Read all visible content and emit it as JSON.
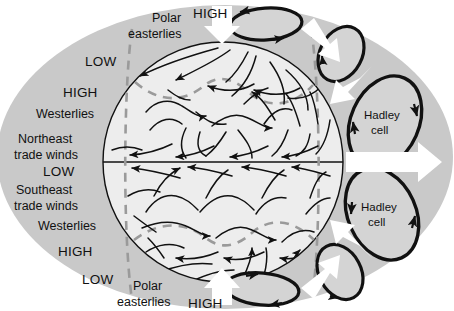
{
  "figure": {
    "colors": {
      "background": "#ffffff",
      "halo_gray": "#c9c9c9",
      "globe_fill": "#ededed",
      "cell_fill": "#d4d4d4",
      "stroke_black": "#111111",
      "dashed_gray": "#9a9a9a",
      "arrow_white": "#ffffff",
      "text": "#111111"
    }
  },
  "labels": {
    "left_stack": [
      {
        "id": "low-north-polar",
        "text": "LOW",
        "x": 99,
        "y": 66,
        "style": "cap",
        "anchor": "middle"
      },
      {
        "id": "high-north-subpolar",
        "text": "HIGH",
        "x": 72,
        "y": 95,
        "style": "cap",
        "anchor": "start"
      },
      {
        "id": "westerlies-north",
        "text": "Westerlies",
        "x": 45,
        "y": 115,
        "style": "word",
        "anchor": "start"
      },
      {
        "id": "northeast-trades-line1",
        "text": "Northeast",
        "x": 23,
        "y": 140,
        "style": "word",
        "anchor": "start"
      },
      {
        "id": "northeast-trades-line2",
        "text": "trade winds",
        "x": 14,
        "y": 155,
        "style": "word",
        "anchor": "start"
      },
      {
        "id": "low-equator",
        "text": "LOW",
        "x": 45,
        "y": 172,
        "style": "cap",
        "anchor": "start"
      },
      {
        "id": "southeast-trades-line1",
        "text": "Southeast",
        "x": 18,
        "y": 190,
        "style": "word",
        "anchor": "start"
      },
      {
        "id": "southeast-trades-line2",
        "text": "trade winds",
        "x": 14,
        "y": 206,
        "style": "word",
        "anchor": "start"
      },
      {
        "id": "westerlies-south",
        "text": "Westerlies",
        "x": 45,
        "y": 226,
        "style": "word",
        "anchor": "start"
      },
      {
        "id": "high-south-subpolar",
        "text": "HIGH",
        "x": 63,
        "y": 253,
        "style": "cap",
        "anchor": "start"
      },
      {
        "id": "low-south-polar",
        "text": "LOW",
        "x": 87,
        "y": 281,
        "style": "cap",
        "anchor": "start"
      }
    ],
    "polar_easterlies_north": {
      "line1": "Polar",
      "line2": "easterlies",
      "x1": 157,
      "y1": 21,
      "x2": 136,
      "y2": 36
    },
    "polar_easterlies_south": {
      "line1": "Polar",
      "line2": "easterlies",
      "x1": 136,
      "y1": 290,
      "x2": 122,
      "y2": 305
    },
    "high_north_pole": {
      "text": "HIGH",
      "x": 196,
      "y": 17
    },
    "high_south_pole": {
      "text": "HIGH",
      "x": 196,
      "y": 307
    },
    "hadley_north": {
      "line1": "Hadley",
      "line2": "cell",
      "x": 385,
      "y": 116,
      "line2_y": 131
    },
    "hadley_south": {
      "line1": "Hadley",
      "line2": "cell",
      "x": 382,
      "y": 208,
      "line2_y": 223
    }
  },
  "geometry": {
    "halo_ellipse": {
      "cx": 225,
      "cy": 157,
      "rx": 228,
      "ry": 152
    },
    "globe": {
      "cx": 223,
      "cy": 162,
      "r": 120
    },
    "equator": {
      "x1": 103,
      "x2": 343,
      "y": 162
    }
  },
  "cells": [
    {
      "id": "polar-cell-north-top",
      "label": "",
      "cx": 266,
      "cy": 24,
      "rx": 36,
      "ry": 16,
      "rot": -4
    },
    {
      "id": "ferrel-cell-north",
      "label": "",
      "cx": 341,
      "cy": 54,
      "rx": 22,
      "ry": 30,
      "rot": 28
    },
    {
      "id": "hadley-cell-north",
      "label": "Hadley cell",
      "cx": 385,
      "cy": 122,
      "rx": 34,
      "ry": 48,
      "rot": 24
    },
    {
      "id": "hadley-cell-south",
      "label": "Hadley cell",
      "cx": 382,
      "cy": 214,
      "rx": 34,
      "ry": 48,
      "rot": -24
    },
    {
      "id": "ferrel-cell-south",
      "label": "",
      "cx": 340,
      "cy": 272,
      "rx": 21,
      "ry": 29,
      "rot": -28
    },
    {
      "id": "polar-cell-south-bottom",
      "label": "",
      "cx": 262,
      "cy": 289,
      "rx": 37,
      "ry": 16,
      "rot": 5
    }
  ],
  "white_arrows": [
    {
      "id": "arrow-north-pole-down",
      "dir": "down"
    },
    {
      "id": "arrow-subpolar-north-down-right",
      "dir": "down-right"
    },
    {
      "id": "arrow-subtropical-north-down",
      "dir": "down-left"
    },
    {
      "id": "arrow-equator-right",
      "dir": "right"
    },
    {
      "id": "arrow-subtropical-south-up",
      "dir": "up-left"
    },
    {
      "id": "arrow-subpolar-south-up-right",
      "dir": "up-right"
    },
    {
      "id": "arrow-south-pole-down",
      "dir": "down"
    },
    {
      "id": "arrow-south-pole-up",
      "dir": "up"
    }
  ]
}
